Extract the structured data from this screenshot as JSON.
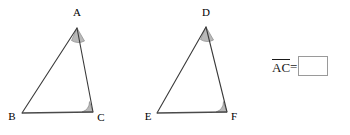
{
  "figure": {
    "background_color": "#ffffff",
    "line_color": "#3a3a3a",
    "angle_fill_color": "#b9b9b9",
    "triangles": [
      {
        "name": "triangle-abc",
        "vertices": [
          {
            "label": "A",
            "x": 77,
            "y": 28,
            "label_x": 77,
            "label_y": 16
          },
          {
            "label": "B",
            "x": 22,
            "y": 113,
            "label_x": 12,
            "label_y": 120
          },
          {
            "label": "C",
            "x": 93,
            "y": 112,
            "label_x": 101,
            "label_y": 121
          }
        ],
        "marked_angles": [
          "A",
          "C"
        ]
      },
      {
        "name": "triangle-def",
        "vertices": [
          {
            "label": "D",
            "x": 206,
            "y": 27,
            "label_x": 206,
            "label_y": 16
          },
          {
            "label": "E",
            "x": 157,
            "y": 113,
            "label_x": 148,
            "label_y": 120
          },
          {
            "label": "F",
            "x": 227,
            "y": 112,
            "label_x": 234,
            "label_y": 120
          }
        ],
        "marked_angles": [
          "D",
          "F"
        ]
      }
    ]
  },
  "answer": {
    "segment_label": "AC",
    "equals": "=",
    "input_value": "",
    "input_placeholder": ""
  }
}
